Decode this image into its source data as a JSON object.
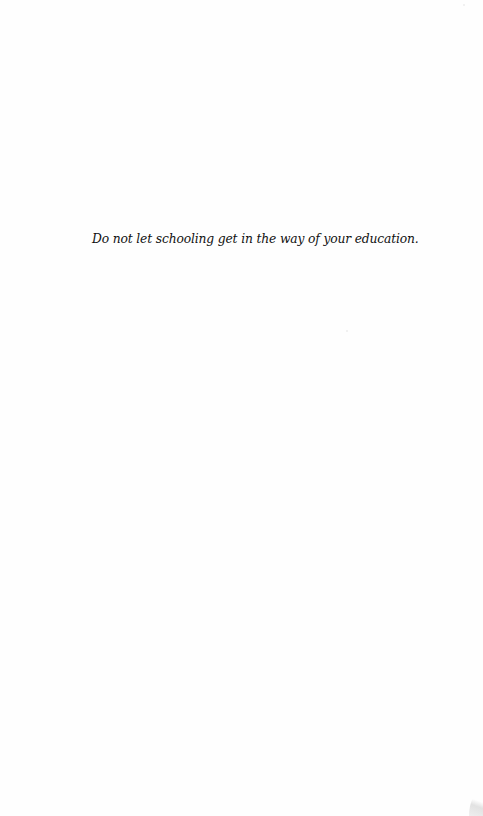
{
  "page": {
    "epigraph": "Do not let schooling get in the way of your education."
  }
}
